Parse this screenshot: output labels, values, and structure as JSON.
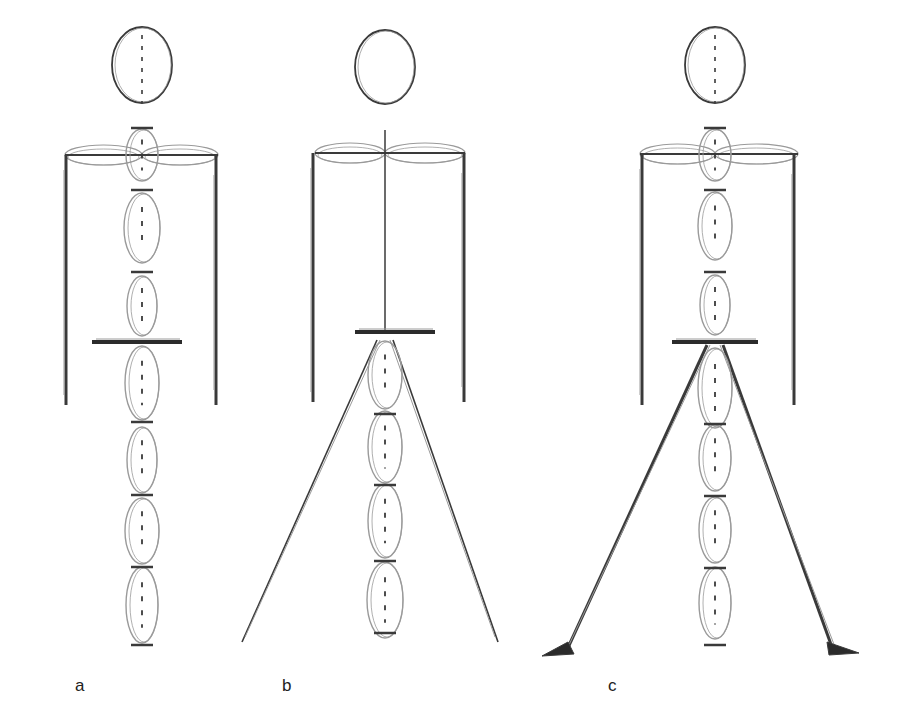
{
  "figure": {
    "colors": {
      "ink": "#3a3a3a",
      "soft": "#9a9a9a",
      "background": "#ffffff"
    },
    "panels": [
      {
        "id": "a",
        "label": "a",
        "label_pos": [
          75,
          690
        ],
        "cx": 142,
        "head": {
          "cy": 65,
          "rx": 30,
          "ry": 38,
          "dashed_axis": true
        },
        "shoulder": {
          "y": 155,
          "x1": 65,
          "x2": 218
        },
        "arms": {
          "left_x": 66,
          "right_x": 216,
          "top": 155,
          "bottom": 405
        },
        "pelvis": {
          "y": 342,
          "x1": 92,
          "x2": 182,
          "thick": true
        },
        "segments": [
          {
            "cy": 155,
            "rx": 16,
            "ry": 26
          },
          {
            "cy": 228,
            "rx": 18,
            "ry": 35
          },
          {
            "cy": 306,
            "rx": 15,
            "ry": 30
          },
          {
            "cy": 383,
            "rx": 17,
            "ry": 37
          },
          {
            "cy": 460,
            "rx": 15,
            "ry": 33
          },
          {
            "cy": 531,
            "rx": 17,
            "ry": 33
          },
          {
            "cy": 605,
            "rx": 16,
            "ry": 38
          }
        ],
        "joints": [
          128,
          190,
          272,
          342,
          422,
          495,
          567,
          645
        ],
        "legs": null
      },
      {
        "id": "b",
        "label": "b",
        "label_pos": [
          282,
          690
        ],
        "cx": 385,
        "head": {
          "cy": 67,
          "rx": 30,
          "ry": 37,
          "dashed_axis": false
        },
        "shoulder": {
          "y": 153,
          "x1": 315,
          "x2": 465
        },
        "arms": {
          "left_x": 313,
          "right_x": 464,
          "top": 153,
          "bottom": 402
        },
        "neck_line": {
          "top": 130,
          "bottom": 332
        },
        "pelvis": {
          "y": 332,
          "x1": 355,
          "x2": 435,
          "thick": true
        },
        "segments": [
          {
            "cy": 375,
            "rx": 17,
            "ry": 34
          },
          {
            "cy": 447,
            "rx": 17,
            "ry": 36
          },
          {
            "cy": 521,
            "rx": 17,
            "ry": 37
          },
          {
            "cy": 600,
            "rx": 18,
            "ry": 38
          }
        ],
        "joints": [
          414,
          485,
          561,
          633
        ],
        "legs": {
          "apex_y": 340,
          "left_x": 242,
          "right_x": 498,
          "bottom_y": 642,
          "feet": false
        }
      },
      {
        "id": "c",
        "label": "c",
        "label_pos": [
          608,
          690
        ],
        "cx": 715,
        "head": {
          "cy": 65,
          "rx": 30,
          "ry": 38,
          "dashed_axis": true
        },
        "shoulder": {
          "y": 154,
          "x1": 640,
          "x2": 798
        },
        "arms": {
          "left_x": 642,
          "right_x": 794,
          "top": 154,
          "bottom": 405
        },
        "pelvis": {
          "y": 342,
          "x1": 672,
          "x2": 758,
          "thick": true
        },
        "segments": [
          {
            "cy": 155,
            "rx": 16,
            "ry": 26
          },
          {
            "cy": 226,
            "rx": 17,
            "ry": 34
          },
          {
            "cy": 305,
            "rx": 15,
            "ry": 30
          },
          {
            "cy": 388,
            "rx": 17,
            "ry": 40
          },
          {
            "cy": 458,
            "rx": 16,
            "ry": 33
          },
          {
            "cy": 530,
            "rx": 16,
            "ry": 33
          },
          {
            "cy": 603,
            "rx": 16,
            "ry": 36
          }
        ],
        "joints": [
          128,
          190,
          272,
          342,
          424,
          496,
          568,
          645
        ],
        "legs": {
          "apex_y": 345,
          "left_x": 548,
          "right_x": 855,
          "bottom_y": 652,
          "feet": true
        }
      }
    ]
  }
}
